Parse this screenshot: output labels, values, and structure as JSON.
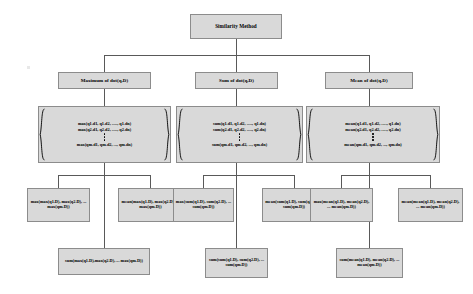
{
  "diagram": {
    "type": "tree",
    "title_node": {
      "label": "Similarity Method"
    },
    "level2": [
      {
        "id": "max-dot",
        "label": "Maximum of dot(q,D)"
      },
      {
        "id": "sum-dot",
        "label": "Sum of dot(q,D)"
      },
      {
        "id": "mean-dot",
        "label": "Mean of dot(q,D)"
      }
    ],
    "matrices": [
      {
        "id": "max-matrix",
        "rows": [
          "max(q1.d1, q1.d2, ....., q1.dn)",
          "max(q2.d1, q2.d2, ....., q2.dn)"
        ],
        "ellipsis": "vertical-dots",
        "last_row": "max(qm.d1, qm.d2, ..., qm.dn)"
      },
      {
        "id": "sum-matrix",
        "rows": [
          "sum(q1.d1, q1.d2, ....., q1.dn)",
          "sum(q2.d1, q2.d2, ....., q2.dn)"
        ],
        "ellipsis": "vertical-dots",
        "last_row": "sum(qm.d1, qm.d2, ..., qm.dn)"
      },
      {
        "id": "mean-matrix",
        "rows": [
          "mean(q1.d1, q1.d2, ....., q1.dn)",
          "mean(q2.d1, q2.d2, ....., q2.dn)"
        ],
        "ellipsis": "vertical-dots",
        "last_row": "mean(qm.d1, qm.d2, ..., qm.dn)"
      }
    ],
    "leaves_row4": [
      {
        "id": "max-max",
        "label": "max(max(q1.D), max(q2.D), ... max(qm.D))"
      },
      {
        "id": "mean-max",
        "label": "mean(max(q1.D), max(q2.D), ... max(qm.D))"
      },
      {
        "id": "max-sum",
        "label": "max(sum(q1.D), sum(q2.D), ... sum(qm.D))"
      },
      {
        "id": "mean-sum",
        "label": "mean(sum(q1.D), sum(q2.D), ... sum(qm.D))"
      },
      {
        "id": "max-mean",
        "label": "max(mean(q1.D), mean(q2.D), ... mean(qm.D))"
      },
      {
        "id": "mean-mean",
        "label": "mean(mean(q1.D), mean(q2.D), ... mean(qm.D))"
      }
    ],
    "leaves_row5": [
      {
        "id": "sum-max",
        "label": "sum(max(q1.D),max(q2.D), ... max(qm.D))"
      },
      {
        "id": "sum-sum",
        "label": "sum(sum(q1.D), sum(q2.D), ... sum(qm.D))"
      },
      {
        "id": "sum-mean",
        "label": "sum(mean(q1.D), mean(q2.D), ... mean(qm.D))"
      }
    ],
    "colors": {
      "node_fill": "#d9d9d9",
      "node_border": "#8c8c8c",
      "connector": "#595959",
      "text": "#000000",
      "background": "#ffffff"
    }
  }
}
